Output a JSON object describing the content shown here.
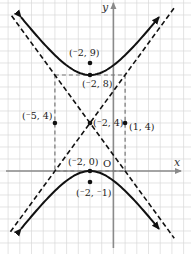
{
  "chart_data": {
    "type": "line",
    "title": "",
    "xlabel": "x",
    "ylabel": "y",
    "origin_label": "O",
    "grid": true,
    "xlim": [
      -9.5,
      6.5
    ],
    "ylim": [
      -6.8,
      14
    ],
    "hyperbola": {
      "center": [
        -2,
        4
      ],
      "a": 4,
      "b": 3,
      "c": 5,
      "orientation": "vertical",
      "equation": "(y-4)^2/16 - (x+2)^2/9 = 1"
    },
    "asymptotes": [
      {
        "name": "asymptote-positive",
        "slope": 1.3333,
        "through": [
          -2,
          4
        ],
        "style": "dashed"
      },
      {
        "name": "asymptote-negative",
        "slope": -1.3333,
        "through": [
          -2,
          4
        ],
        "style": "dashed"
      }
    ],
    "central_rectangle": {
      "x": [
        -5,
        1
      ],
      "y": [
        0,
        8
      ],
      "style": "dashed"
    },
    "points": [
      {
        "label": "(⁻2, 9)",
        "x": -2,
        "y": 9,
        "role": "focus"
      },
      {
        "label": "(⁻2, 8)",
        "x": -2,
        "y": 8,
        "role": "vertex"
      },
      {
        "label": "(⁻5, 4)",
        "x": -5,
        "y": 4,
        "role": "co-vertex"
      },
      {
        "label": "(⁻2, 4)",
        "x": -2,
        "y": 4,
        "role": "center"
      },
      {
        "label": "(1, 4)",
        "x": 1,
        "y": 4,
        "role": "co-vertex"
      },
      {
        "label": "(⁻2, 0)",
        "x": -2,
        "y": 0,
        "role": "vertex"
      },
      {
        "label": "(⁻2, ⁻1)",
        "x": -2,
        "y": -1,
        "role": "focus"
      }
    ],
    "colors": {
      "curve": "#111111",
      "asymptote": "#111111",
      "rectangle": "#777777",
      "axis": "#8a8a8a",
      "grid": "#d9d9d9"
    }
  },
  "labels": {
    "x_axis": "x",
    "y_axis": "y",
    "origin": "O",
    "p_focus_top": "(⁻2, 9)",
    "p_vertex_top": "(⁻2, 8)",
    "p_left": "(⁻5, 4)",
    "p_center": "(⁻2, 4)",
    "p_right": "(1, 4)",
    "p_vertex_bottom": "(⁻2, 0)",
    "p_focus_bottom": "(⁻2, ⁻1)"
  }
}
